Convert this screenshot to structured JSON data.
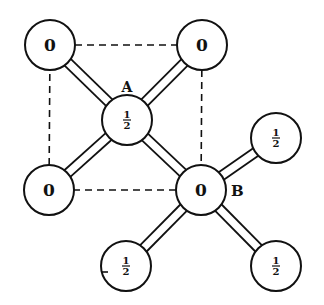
{
  "diagram": {
    "nodes": [
      {
        "id": "tl",
        "label": "0",
        "x": 50,
        "y": 45
      },
      {
        "id": "tr",
        "label": "0",
        "x": 202,
        "y": 45
      },
      {
        "id": "A",
        "label": "½",
        "x": 127,
        "y": 120,
        "tag": "A"
      },
      {
        "id": "r",
        "label": "½",
        "x": 276,
        "y": 138
      },
      {
        "id": "bl",
        "label": "0",
        "x": 49,
        "y": 190
      },
      {
        "id": "B",
        "label": "0",
        "x": 201,
        "y": 190,
        "tag": "B"
      },
      {
        "id": "bb",
        "label": "½",
        "x": 126,
        "y": 266
      },
      {
        "id": "br",
        "label": "½",
        "x": 276,
        "y": 266
      }
    ],
    "bonds": [
      [
        "tl",
        "A"
      ],
      [
        "tr",
        "A"
      ],
      [
        "bl",
        "A"
      ],
      [
        "B",
        "A"
      ],
      [
        "B",
        "r"
      ],
      [
        "B",
        "bb"
      ],
      [
        "B",
        "br"
      ]
    ],
    "dashed": [
      [
        "tl",
        "tr"
      ],
      [
        "tr",
        "B"
      ],
      [
        "B",
        "bl"
      ],
      [
        "bl",
        "tl"
      ]
    ],
    "labels": {
      "A": "A",
      "B": "B"
    },
    "radius": 25
  }
}
